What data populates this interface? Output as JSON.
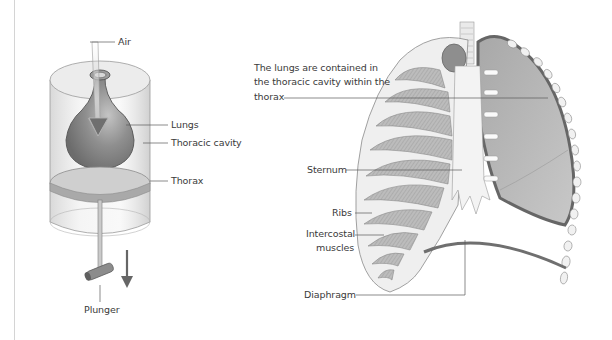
{
  "figure": {
    "left_panel": {
      "title": "Bell-jar lung model",
      "labels": {
        "air": "Air",
        "lungs": "Lungs",
        "thoracic_cavity": "Thoracic cavity",
        "thorax": "Thorax",
        "plunger": "Plunger"
      }
    },
    "right_panel": {
      "title": "Human rib cage and lungs",
      "labels": {
        "caption_line1": "The lungs are contained in",
        "caption_line2": "the thoracic cavity within the",
        "caption_line3": "thorax",
        "sternum": "Sternum",
        "ribs": "Ribs",
        "intercostal_line1": "Intercostal",
        "intercostal_line2": "muscles",
        "diaphragm": "Diaphragm"
      }
    },
    "colors": {
      "line": "#5a5a5a",
      "lung_fill": "#8e8e8e",
      "bone": "#ededed",
      "muscle": "#b5b5b5",
      "diaphragm": "#6f6f6f",
      "glass": "#e4e4e4"
    }
  }
}
